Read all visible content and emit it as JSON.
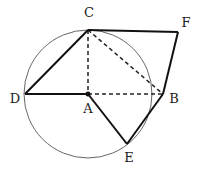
{
  "diagram": {
    "type": "geometry",
    "circle": {
      "center": "A",
      "cx": 88,
      "cy": 94,
      "r": 64,
      "stroke": "#555555"
    },
    "points": {
      "A": {
        "x": 88,
        "y": 94,
        "label": "A",
        "lx": 88,
        "ly": 112
      },
      "B": {
        "x": 163,
        "y": 94,
        "label": "B",
        "lx": 174,
        "ly": 103
      },
      "C": {
        "x": 88,
        "y": 30,
        "label": "C",
        "lx": 89,
        "ly": 17
      },
      "D": {
        "x": 25,
        "y": 94,
        "label": "D",
        "lx": 15,
        "ly": 103
      },
      "E": {
        "x": 127,
        "y": 144,
        "label": "E",
        "lx": 129,
        "ly": 161
      },
      "F": {
        "x": 178,
        "y": 32,
        "label": "F",
        "lx": 186,
        "ly": 27
      }
    },
    "solid_segments": [
      "DC",
      "DA",
      "AE",
      "EB",
      "BF",
      "CF"
    ],
    "dashed_segments": [
      "CA",
      "AB",
      "CB"
    ],
    "labels": {
      "A": "A",
      "B": "B",
      "C": "C",
      "D": "D",
      "E": "E",
      "F": "F"
    }
  }
}
